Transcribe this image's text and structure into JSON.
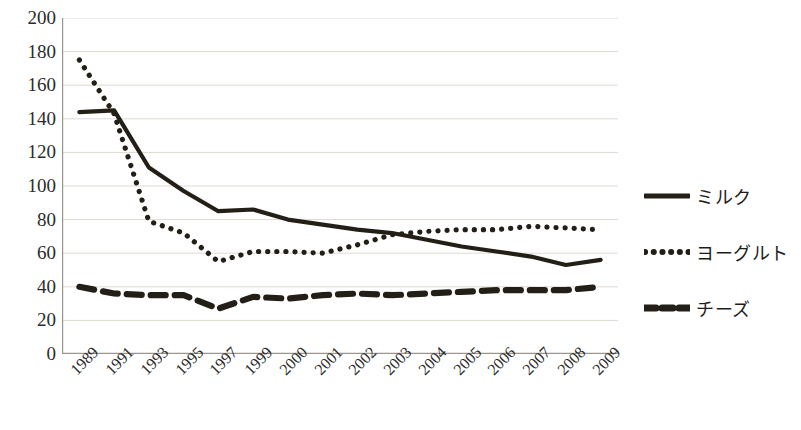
{
  "chart_data": {
    "type": "line",
    "title": "",
    "xlabel": "",
    "ylabel": "",
    "ylim": [
      0,
      200
    ],
    "ytick_step": 20,
    "yticks": [
      200,
      180,
      160,
      140,
      120,
      100,
      80,
      60,
      40,
      20,
      0
    ],
    "grid": true,
    "legend_position": "right",
    "categories": [
      "1989",
      "1991",
      "1993",
      "1995",
      "1997",
      "1999",
      "2000",
      "2001",
      "2002",
      "2003",
      "2004",
      "2005",
      "2006",
      "2007",
      "2008",
      "2009"
    ],
    "series": [
      {
        "name": "ミルク",
        "style": "solid",
        "color": "#231f16",
        "values": [
          144,
          145,
          111,
          97,
          85,
          86,
          80,
          77,
          74,
          72,
          68,
          64,
          61,
          58,
          53,
          56
        ]
      },
      {
        "name": "ヨーグルト",
        "style": "dotted",
        "color": "#231f16",
        "values": [
          175,
          143,
          79,
          72,
          55,
          61,
          61,
          60,
          65,
          71,
          73,
          74,
          74,
          76,
          75,
          74
        ]
      },
      {
        "name": "チーズ",
        "style": "dashed",
        "color": "#231f16",
        "values": [
          40,
          36,
          35,
          35,
          27,
          34,
          33,
          35,
          36,
          35,
          36,
          37,
          38,
          38,
          38,
          40
        ]
      }
    ]
  },
  "legend": {
    "items": [
      {
        "label": "ミルク",
        "style": "solid"
      },
      {
        "label": "ヨーグルト",
        "style": "dotted"
      },
      {
        "label": "チーズ",
        "style": "dashed"
      }
    ]
  },
  "axis": {
    "y_labels": [
      "200",
      "180",
      "160",
      "140",
      "120",
      "100",
      "80",
      "60",
      "40",
      "20",
      "0"
    ],
    "x_labels": [
      "1989",
      "1991",
      "1993",
      "1995",
      "1997",
      "1999",
      "2000",
      "2001",
      "2002",
      "2003",
      "2004",
      "2005",
      "2006",
      "2007",
      "2008",
      "2009"
    ]
  },
  "colors": {
    "ink": "#231f16",
    "grid": "#dedad2",
    "axis": "#9a968e",
    "text": "#2b2b2b"
  }
}
